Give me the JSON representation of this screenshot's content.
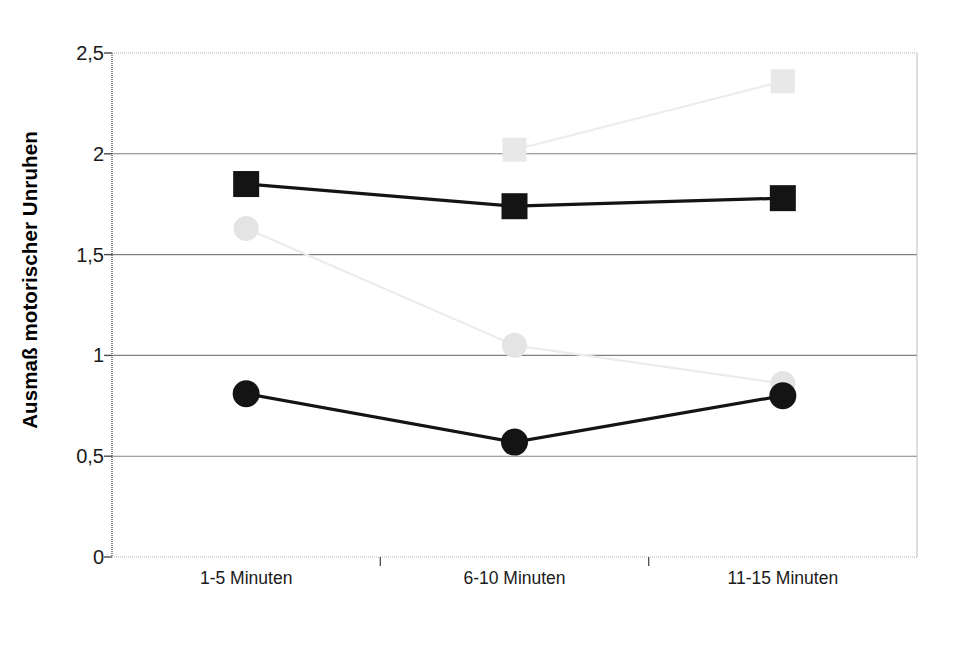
{
  "chart_data": {
    "type": "line",
    "title": "",
    "xlabel": "",
    "ylabel": "Ausmaß motorischer Unruhen",
    "categories": [
      "1-5 Minuten",
      "6-10 Minuten",
      "11-15 Minuten"
    ],
    "ylim": [
      0,
      2.5
    ],
    "yticks": [
      0,
      0.5,
      1,
      1.5,
      2,
      2.5
    ],
    "ytick_labels": [
      "0",
      "0,5",
      "1",
      "1,5",
      "2",
      "2,5"
    ],
    "grid": true,
    "legend": "none",
    "series": [
      {
        "name": "gray-square-series",
        "marker": "square",
        "color": "#e8e8e8",
        "line_color": "#ececec",
        "values": [
          null,
          2.02,
          2.36
        ]
      },
      {
        "name": "black-square-series",
        "marker": "square",
        "color": "#141414",
        "line_color": "#141414",
        "values": [
          1.85,
          1.74,
          1.78
        ]
      },
      {
        "name": "gray-circle-series",
        "marker": "circle",
        "color": "#e4e4e4",
        "line_color": "#ececec",
        "values": [
          1.63,
          1.05,
          0.86
        ]
      },
      {
        "name": "black-circle-series",
        "marker": "circle",
        "color": "#141414",
        "line_color": "#141414",
        "values": [
          0.81,
          0.57,
          0.8
        ]
      }
    ]
  },
  "axis": {
    "y_title": "Ausmaß motorischer Unruhen"
  },
  "colors": {
    "axis": "#4d4d4d",
    "grid": "#808080",
    "black_series": "#141414",
    "gray_series": "#e8e8e8",
    "background": "#ffffff"
  }
}
